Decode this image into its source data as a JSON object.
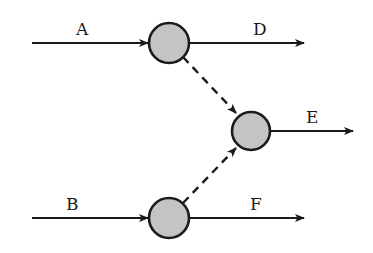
{
  "diagram": {
    "type": "flow-network",
    "colors": {
      "stroke": "#1a1a1a",
      "node_fill": "#c4c4c4",
      "background": "#ffffff"
    },
    "nodes": [
      {
        "id": "n1",
        "cx": 169,
        "cy": 43,
        "r": 20
      },
      {
        "id": "n2",
        "cx": 251,
        "cy": 131,
        "r": 19
      },
      {
        "id": "n3",
        "cx": 169,
        "cy": 218,
        "r": 20
      }
    ],
    "edges": [
      {
        "id": "A",
        "label": "A",
        "style": "solid",
        "from": "input",
        "to": "n1"
      },
      {
        "id": "D",
        "label": "D",
        "style": "solid",
        "from": "n1",
        "to": "output"
      },
      {
        "id": "B",
        "label": "B",
        "style": "solid",
        "from": "input",
        "to": "n3"
      },
      {
        "id": "F",
        "label": "F",
        "style": "solid",
        "from": "n3",
        "to": "output"
      },
      {
        "id": "E",
        "label": "E",
        "style": "solid",
        "from": "n2",
        "to": "output"
      },
      {
        "id": "n1-n2",
        "label": "",
        "style": "dashed",
        "from": "n1",
        "to": "n2"
      },
      {
        "id": "n3-n2",
        "label": "",
        "style": "dashed",
        "from": "n3",
        "to": "n2"
      }
    ],
    "labels": {
      "A": "A",
      "B": "B",
      "D": "D",
      "E": "E",
      "F": "F"
    }
  }
}
